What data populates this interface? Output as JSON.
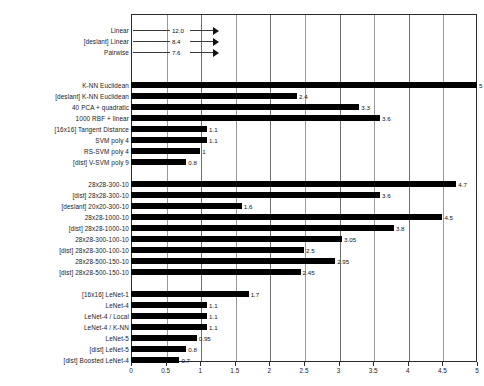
{
  "chart_data": {
    "type": "bar",
    "orientation": "horizontal",
    "title": "",
    "xlabel": "",
    "ylabel": "",
    "xlim": [
      0,
      5
    ],
    "grid": true,
    "legend": "none",
    "xticks": [
      "0",
      "0.5",
      "1",
      "1.5",
      "2",
      "2.5",
      "3",
      "3.5",
      "4",
      "4.5",
      "5"
    ],
    "xtick_values": [
      0,
      0.5,
      1,
      1.5,
      2,
      2.5,
      3,
      3.5,
      4,
      4.5,
      5
    ],
    "groups": [
      {
        "name": "linear-classifiers",
        "offscale": true,
        "rows": [
          {
            "label": "Linear",
            "value": 12.0,
            "value_text": "12.0"
          },
          {
            "label": "[deslant] Linear",
            "value": 8.4,
            "value_text": "8.4"
          },
          {
            "label": "Pairwise",
            "value": 7.6,
            "value_text": "7.6"
          }
        ]
      },
      {
        "name": "classifiers",
        "offscale": false,
        "rows": [
          {
            "label": "K-NN Euclidean",
            "value": 5.0,
            "value_text": "5"
          },
          {
            "label": "[deslant] K-NN Euclidean",
            "value": 2.4,
            "value_text": "2.4"
          },
          {
            "label": "40 PCA + quadratic",
            "value": 3.3,
            "value_text": "3.3"
          },
          {
            "label": "1000 RBF + linear",
            "value": 3.6,
            "value_text": "3.6"
          },
          {
            "label": "[16x16] Tangent Distance",
            "value": 1.1,
            "value_text": "1.1"
          },
          {
            "label": "SVM poly 4",
            "value": 1.1,
            "value_text": "1.1"
          },
          {
            "label": "RS-SVM poly 4",
            "value": 1.0,
            "value_text": "1"
          },
          {
            "label": "[dist] V-SVM poly 9",
            "value": 0.8,
            "value_text": "0.8"
          }
        ]
      },
      {
        "name": "fully-connected-nets",
        "offscale": false,
        "rows": [
          {
            "label": "28x28-300-10",
            "value": 4.7,
            "value_text": "4.7"
          },
          {
            "label": "[dist] 28x28-300-10",
            "value": 3.6,
            "value_text": "3.6"
          },
          {
            "label": "[deslant] 20x20-300-10",
            "value": 1.6,
            "value_text": "1.6"
          },
          {
            "label": "28x28-1000-10",
            "value": 4.5,
            "value_text": "4.5"
          },
          {
            "label": "[dist] 28x28-1000-10",
            "value": 3.8,
            "value_text": "3.8"
          },
          {
            "label": "28x28-300-100-10",
            "value": 3.05,
            "value_text": "3.05"
          },
          {
            "label": "[dist] 28x28-300-100-10",
            "value": 2.5,
            "value_text": "2.5"
          },
          {
            "label": "28x28-500-150-10",
            "value": 2.95,
            "value_text": "2.95"
          },
          {
            "label": "[dist] 28x28-500-150-10",
            "value": 2.45,
            "value_text": "2.45"
          }
        ]
      },
      {
        "name": "convolutional-nets",
        "offscale": false,
        "rows": [
          {
            "label": "[16x16] LeNet-1",
            "value": 1.7,
            "value_text": "1.7"
          },
          {
            "label": "LeNet-4",
            "value": 1.1,
            "value_text": "1.1"
          },
          {
            "label": "LeNet-4 / Local",
            "value": 1.1,
            "value_text": "1.1"
          },
          {
            "label": "LeNet-4 / K-NN",
            "value": 1.1,
            "value_text": "1.1"
          },
          {
            "label": "LeNet-5",
            "value": 0.95,
            "value_text": "0.95"
          },
          {
            "label": "[dist] LeNet-5",
            "value": 0.8,
            "value_text": "0.8"
          },
          {
            "label": "[dist] Boosted LeNet-4",
            "value": 0.7,
            "value_text": "0.7"
          }
        ]
      }
    ]
  },
  "colors": {
    "bar": "#000000",
    "grid": "#9a9a9a",
    "axis": "#2b2b2b",
    "text": "#1a1a1a",
    "background": "#ffffff"
  }
}
